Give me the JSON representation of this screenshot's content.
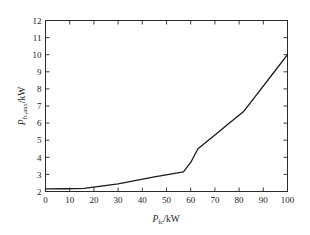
{
  "figure": {
    "background_color": "#ffffff",
    "line_color": "#1a1a1a",
    "axis_color": "#2b2b2b"
  },
  "chart_data": {
    "type": "line",
    "title": "",
    "xlabel": "P_fc/kW",
    "xlabel_symbol": "P",
    "xlabel_subscript": "fc",
    "xlabel_unit": "/kW",
    "ylabel": "P_fc,aux/kW",
    "ylabel_symbol": "P",
    "ylabel_subscript": "fc,aux",
    "ylabel_unit": "/kW",
    "xlim": [
      0,
      100
    ],
    "ylim": [
      2,
      12
    ],
    "xticks": [
      0,
      10,
      20,
      30,
      40,
      50,
      60,
      70,
      80,
      90,
      100
    ],
    "yticks": [
      2,
      3,
      4,
      5,
      6,
      7,
      8,
      9,
      10,
      11,
      12
    ],
    "xtick_labels": [
      "0",
      "10",
      "20",
      "30",
      "40",
      "50",
      "60",
      "70",
      "80",
      "90",
      "100"
    ],
    "ytick_labels": [
      "2",
      "3",
      "4",
      "5",
      "6",
      "7",
      "8",
      "9",
      "10",
      "11",
      "12"
    ],
    "grid": false,
    "legend": null,
    "series": [
      {
        "name": "fuel cell auxiliary power",
        "x": [
          0,
          8,
          16,
          30,
          45,
          57,
          60,
          63,
          70,
          76,
          82,
          88,
          94,
          100
        ],
        "y": [
          2.15,
          2.16,
          2.18,
          2.45,
          2.85,
          3.15,
          3.7,
          4.5,
          5.3,
          6.0,
          6.7,
          7.8,
          8.9,
          10.0
        ]
      }
    ]
  }
}
